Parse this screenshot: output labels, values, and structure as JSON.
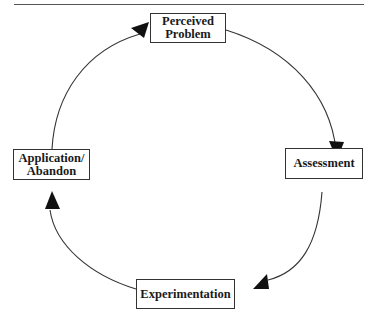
{
  "diagram": {
    "type": "cycle",
    "nodes": [
      {
        "id": "perceived-problem",
        "label": "Perceived\nProblem"
      },
      {
        "id": "assessment",
        "label": "Assessment"
      },
      {
        "id": "experimentation",
        "label": "Experimentation"
      },
      {
        "id": "application-abandon",
        "label": "Application/\nAbandon"
      }
    ],
    "edges": [
      {
        "from": "perceived-problem",
        "to": "assessment"
      },
      {
        "from": "assessment",
        "to": "experimentation"
      },
      {
        "from": "experimentation",
        "to": "application-abandon"
      },
      {
        "from": "application-abandon",
        "to": "perceived-problem"
      }
    ],
    "line_color": "#333333",
    "arrow_color": "#111111"
  }
}
